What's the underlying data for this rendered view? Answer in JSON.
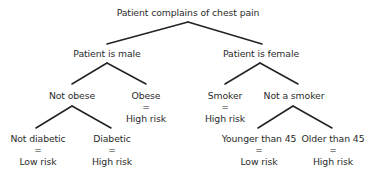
{
  "diagram": {
    "type": "decision-tree",
    "root": {
      "label": "Patient complains of chest pain"
    },
    "nodes": {
      "male": {
        "label": "Patient is male"
      },
      "female": {
        "label": "Patient is female"
      },
      "not_obese": {
        "label": "Not obese"
      },
      "obese": {
        "label": "Obese",
        "eq": "=",
        "outcome": "High risk"
      },
      "smoker": {
        "label": "Smoker",
        "eq": "=",
        "outcome": "High risk"
      },
      "not_smoker": {
        "label": "Not a smoker"
      },
      "not_diabetic": {
        "label": "Not diabetic",
        "eq": "=",
        "outcome": "Low risk"
      },
      "diabetic": {
        "label": "Diabetic",
        "eq": "=",
        "outcome": "High risk"
      },
      "younger": {
        "label": "Younger than 45",
        "eq": "=",
        "outcome": "Low risk"
      },
      "older": {
        "label": "Older than 45",
        "eq": "=",
        "outcome": "High risk"
      }
    },
    "edges": [
      [
        "root",
        "male"
      ],
      [
        "root",
        "female"
      ],
      [
        "male",
        "not_obese"
      ],
      [
        "male",
        "obese"
      ],
      [
        "not_obese",
        "not_diabetic"
      ],
      [
        "not_obese",
        "diabetic"
      ],
      [
        "female",
        "smoker"
      ],
      [
        "female",
        "not_smoker"
      ],
      [
        "not_smoker",
        "younger"
      ],
      [
        "not_smoker",
        "older"
      ]
    ]
  }
}
